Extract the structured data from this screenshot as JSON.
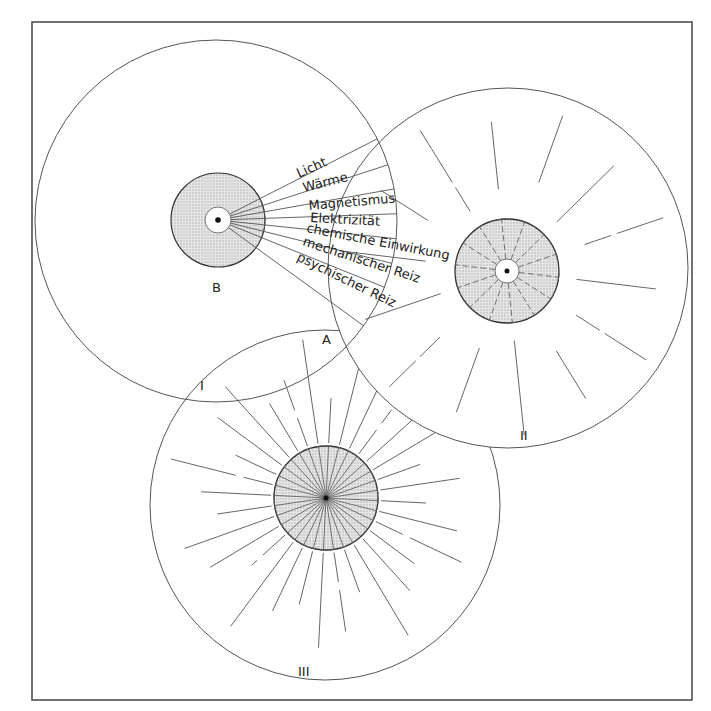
{
  "diagram": {
    "frame": {
      "x": 32,
      "y": 22,
      "width": 660,
      "height": 678
    },
    "colors": {
      "line": "#555555",
      "shade": "#d9d9d9",
      "frame": "#444444",
      "text": "#222222"
    },
    "circle_I": {
      "label": "I",
      "outer": {
        "cx": 216,
        "cy": 221,
        "r": 181
      },
      "inner_label": "B",
      "inner_label_2": "A",
      "nucleus": {
        "cx": 218,
        "cy": 220,
        "r_shaded": 47,
        "r_white": 13,
        "r_dot": 3
      },
      "stimuli": [
        "Licht",
        "Wärme",
        "Magnetismus",
        "Elektrizität",
        "chemische Einwirkung",
        "mechanischer Reiz",
        "psychischer Reiz"
      ]
    },
    "circle_II": {
      "label": "II",
      "outer": {
        "cx": 508,
        "cy": 268,
        "r": 180
      },
      "nucleus": {
        "cx": 507,
        "cy": 271,
        "r_shaded": 52,
        "r_white": 12,
        "r_dot": 3
      },
      "ray_count": 14
    },
    "circle_III": {
      "label": "III",
      "outer": {
        "cx": 325,
        "cy": 505,
        "r": 175
      },
      "nucleus": {
        "cx": 326,
        "cy": 498,
        "r_shaded": 52,
        "r_white": 0,
        "r_dot": 3
      },
      "ray_count": 32
    }
  }
}
